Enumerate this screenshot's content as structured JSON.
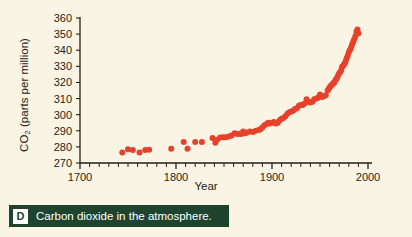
{
  "figure": {
    "background_color": "#faf4e4",
    "point_color": "#e8402a",
    "axis_color": "#231f20"
  },
  "caption": {
    "badge": "D",
    "text": "Carbon dioxide in the atmosphere.",
    "bar_color": "#1e4430",
    "badge_bg": "#ffffff"
  },
  "chart_data": {
    "type": "scatter",
    "title": "",
    "xlabel": "Year",
    "ylabel": "CO2 (parts per million)",
    "ylabel_main": "CO",
    "ylabel_sub": "2",
    "ylabel_rest": " (parts per million)",
    "xlim": [
      1700,
      2000
    ],
    "ylim": [
      270,
      360
    ],
    "xticks": [
      1700,
      1800,
      1900,
      2000
    ],
    "xtick_labels": [
      "1700",
      "1800",
      "1900",
      "2000"
    ],
    "xtick_minor_step": 10,
    "yticks": [
      270,
      280,
      290,
      300,
      310,
      320,
      330,
      340,
      350,
      360
    ],
    "ytick_labels": [
      "270",
      "280",
      "290",
      "300",
      "310",
      "320",
      "330",
      "340",
      "350",
      "360"
    ],
    "grid": false,
    "legend": "none",
    "marker": "circle",
    "marker_size": 3,
    "series": [
      {
        "name": "Atmospheric CO2 concentration",
        "color": "#e8402a",
        "x": [
          1744,
          1750,
          1755,
          1762,
          1768,
          1772,
          1795,
          1808,
          1812,
          1820,
          1827,
          1838,
          1841,
          1843,
          1846,
          1849,
          1852,
          1855,
          1858,
          1861,
          1864,
          1866,
          1868,
          1870,
          1872,
          1874,
          1877,
          1880,
          1883,
          1886,
          1888,
          1890,
          1892,
          1894,
          1896,
          1898,
          1900,
          1902,
          1904,
          1906,
          1908,
          1910,
          1912,
          1914,
          1916,
          1918,
          1920,
          1922,
          1924,
          1926,
          1928,
          1930,
          1932,
          1934,
          1936,
          1938,
          1940,
          1942,
          1944,
          1946,
          1948,
          1950,
          1952,
          1954,
          1956,
          1958,
          1959,
          1960,
          1961,
          1962,
          1963,
          1964,
          1965,
          1966,
          1967,
          1968,
          1969,
          1970,
          1971,
          1972,
          1973,
          1974,
          1975,
          1976,
          1977,
          1978,
          1979,
          1980,
          1981,
          1982,
          1983,
          1984,
          1985,
          1986,
          1987,
          1988,
          1989,
          1990
        ],
        "y": [
          276.5,
          278.5,
          278.0,
          276.5,
          278.0,
          278.2,
          278.8,
          283.0,
          278.8,
          283.0,
          283.0,
          285.5,
          282.5,
          284.5,
          285.8,
          286.0,
          286.0,
          286.5,
          287.0,
          288.5,
          288.0,
          288.2,
          288.0,
          289.5,
          288.5,
          289.0,
          289.5,
          289.2,
          290.0,
          290.5,
          291.0,
          292.0,
          293.5,
          294.0,
          295.0,
          294.5,
          295.0,
          295.5,
          294.5,
          295.0,
          296.5,
          297.5,
          298.0,
          299.0,
          300.5,
          301.5,
          302.0,
          302.5,
          303.5,
          304.0,
          305.5,
          306.0,
          306.0,
          307.0,
          309.5,
          308.0,
          307.5,
          308.0,
          309.5,
          310.0,
          310.5,
          312.5,
          311.0,
          311.5,
          312.0,
          315.0,
          315.8,
          316.9,
          317.6,
          318.4,
          318.9,
          319.6,
          320.0,
          321.4,
          322.2,
          323.0,
          324.6,
          325.7,
          326.3,
          327.5,
          329.7,
          330.2,
          331.1,
          332.0,
          333.8,
          335.4,
          336.8,
          338.7,
          340.0,
          341.0,
          342.7,
          344.4,
          345.9,
          347.2,
          348.9,
          351.5,
          352.9,
          350.5
        ]
      }
    ]
  }
}
